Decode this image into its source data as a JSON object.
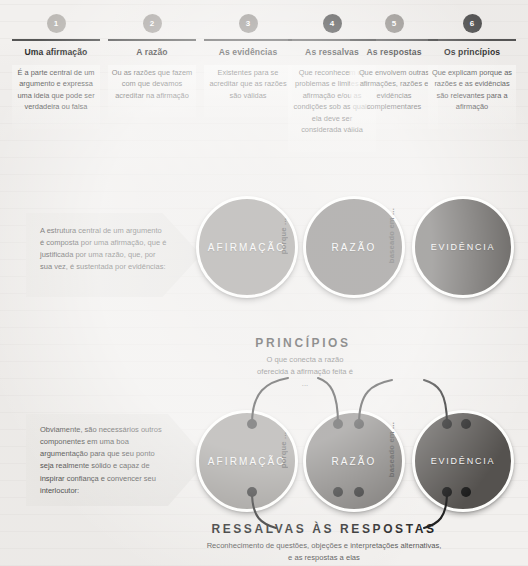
{
  "columns": [
    {
      "number": "1",
      "title": "Uma afirmação",
      "body": "É a parte central de um argumento e expressa uma ideia que pode ser verdadeira ou falsa",
      "color": "#b9b6b2"
    },
    {
      "number": "2",
      "title": "A razão",
      "body": "Ou as razões que fazem com que devamos acreditar na afirmação",
      "color": "#a6a29e"
    },
    {
      "number": "3",
      "title": "As evidências",
      "body": "Existentes para se acreditar que as razões são válidas",
      "color": "#8d8985"
    },
    {
      "number": "4",
      "title": "As ressalvas",
      "body": "Que reconhecem os problemas e limites da afirmação e/ou as condições sob as quais ela deve ser considerada válida",
      "color": "#3b3b3b"
    },
    {
      "number": "5",
      "title": "As respostas",
      "body": "Que envolvem outras afirmações, razões e evidências complementares",
      "color": "#8d8985"
    },
    {
      "number": "6",
      "title": "Os princípios",
      "body": "Que explicam porque as razões e as evidências são relevantes para a afirmação",
      "color": "#4a4a4a"
    }
  ],
  "diagram_top": {
    "callout": "A estrutura central de um argumento é composta por uma afirmação, que é justificada por uma razão, que, por sua vez, é sustentada por evidências:",
    "circles": [
      {
        "label": "AFIRMAÇÃO",
        "color": "#8e8b87"
      },
      {
        "label": "RAZÃO",
        "color": "#6e6b68"
      },
      {
        "label": "EVIDÊNCIA",
        "color": "#55524f"
      }
    ],
    "connectors": [
      "porque ...",
      "baseado em ..."
    ]
  },
  "diagram_bottom": {
    "callout": "Obviamente, são necessários outros componentes em uma boa argumentação para que seu ponto seja realmente sólido e capaz de inspirar confiança e convencer seu interlocutor:",
    "circles": [
      {
        "label": "AFIRMAÇÃO",
        "color": "#8e8b87"
      },
      {
        "label": "RAZÃO",
        "color": "#6e6b68"
      },
      {
        "label": "EVIDÊNCIA",
        "color": "#55524f"
      }
    ],
    "connectors": [
      "porque ...",
      "baseado em ..."
    ],
    "top_section": {
      "title": "PRINCÍPIOS",
      "subtitle": "O que conecta a razão oferecida à afirmação feita é ..."
    },
    "bottom_section": {
      "title": "RESSALVAS ÀS RESPOSTAS",
      "subtitle": "Reconhecimento de questões, objeções e interpretações alternativas, e as respostas a elas"
    }
  }
}
